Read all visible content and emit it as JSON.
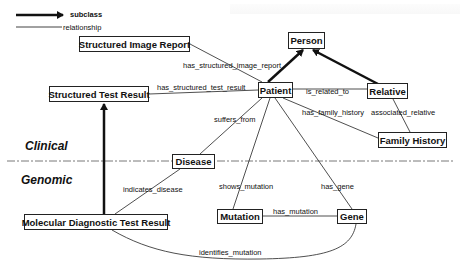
{
  "legend": {
    "subclass_label": "subclass",
    "relationship_label": "relationship"
  },
  "sections": {
    "clinical": "Clinical",
    "genomic": "Genomic"
  },
  "nodes": {
    "structured_image_report": "Structured Image Report",
    "structured_test_result": "Structured Test Result",
    "person": "Person",
    "patient": "Patient",
    "relative": "Relative",
    "family_history": "Family History",
    "disease": "Disease",
    "molecular_diagnostic_test_result": "Molecular Diagnostic Test Result",
    "mutation": "Mutation",
    "gene": "Gene"
  },
  "edges": {
    "has_structured_image_report": "has_structured_image_report",
    "has_structured_test_result": "has_structured_test_result",
    "is_related_to": "is_related_to",
    "has_family_history": "has_family_history",
    "associated_relative": "associated_relative",
    "suffers_from": "suffers_from",
    "indicates_disease": "indicates_disease",
    "shows_mutation": "shows_mutation",
    "has_gene": "has_gene",
    "has_mutation": "has_mutation",
    "identifies_mutation": "identifies_mutation"
  },
  "colors": {
    "line": "#222222",
    "divider": "#555555",
    "background": "#ffffff"
  }
}
